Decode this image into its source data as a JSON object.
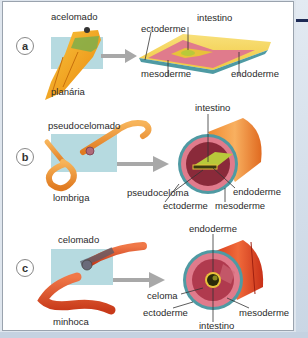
{
  "figure": {
    "type": "biology-diagram",
    "topic": "body cavities (celoma)",
    "panels": [
      {
        "letter": "a",
        "type_label": "acelomado",
        "organism": "planária",
        "cross_section_labels": [
          "ectoderme",
          "intestino",
          "mesoderme",
          "endoderme"
        ]
      },
      {
        "letter": "b",
        "type_label": "pseudocelomado",
        "organism": "lombriga",
        "cross_section_labels": [
          "intestino",
          "pseudoceloma",
          "endoderme",
          "ectoderme",
          "mesoderme"
        ]
      },
      {
        "letter": "c",
        "type_label": "celomado",
        "organism": "minhoca",
        "cross_section_labels": [
          "endoderme",
          "celoma",
          "ectoderme",
          "intestino",
          "mesoderme"
        ]
      }
    ]
  },
  "colors": {
    "ectoderm": "#4f9aa3",
    "mesoderm": "#e07b8c",
    "endoderm": "#e8c23a",
    "intestine": "#b9c93a",
    "planaria": "#f0a020",
    "roundworm": "#f29a3a",
    "earthworm": "#e0502a",
    "magnifier_box": "#a9d3da",
    "arrow": "#a8a8a8"
  }
}
